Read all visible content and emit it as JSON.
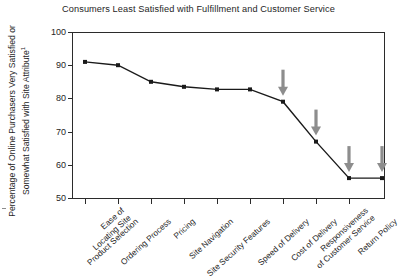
{
  "chart_data": {
    "type": "line",
    "title": "Consumers Least Satisfied with Fulfillment and Customer Service",
    "xlabel": "",
    "ylabel": "Percentage of Online Purchasers Very Satisfied or Somewhat Satisfied with Site Attribute",
    "ylabel_line1": "Percentage of Online Purchasers Very Satisfied or",
    "ylabel_line2": "Somewhat Satisfied with Site Attribute",
    "ylabel_footnote_marker": "1",
    "ylim": [
      50,
      100
    ],
    "yticks": [
      100,
      90,
      80,
      70,
      60,
      50
    ],
    "ytick_labels": [
      "100",
      "90",
      "80",
      "70",
      "60",
      "50"
    ],
    "grid": false,
    "legend": false,
    "categories": [
      "Ease of Locating Site",
      "Product Selection",
      "Ordering Process",
      "Pricing",
      "Site Navigation",
      "Site Security Features",
      "Speed of Delivery",
      "Cost of Delivery",
      "Responsiveness of Customer Service",
      "Return Policy"
    ],
    "category_lines": [
      [
        "Ease of",
        "Locating Site"
      ],
      [
        "Product Selection"
      ],
      [
        "Ordering Process"
      ],
      [
        "Pricing"
      ],
      [
        "Site Navigation"
      ],
      [
        "Site Security Features"
      ],
      [
        "Speed of Delivery"
      ],
      [
        "Cost of Delivery"
      ],
      [
        "Responsiveness",
        "of Customer Service"
      ],
      [
        "Return Policy"
      ]
    ],
    "values": [
      91,
      90,
      85,
      83.5,
      82.7,
      82.7,
      79,
      67,
      56,
      56
    ],
    "series": [
      {
        "name": "Percentage Satisfied",
        "values": [
          91,
          90,
          85,
          83.5,
          82.7,
          82.7,
          79,
          67,
          56,
          56
        ],
        "line_color": "#1a1a1a",
        "marker": "square",
        "marker_color": "#1a1a1a"
      }
    ],
    "annotations": [
      {
        "kind": "arrow",
        "direction": "down",
        "target_category": "Speed of Delivery",
        "target_value": 79,
        "color": "#8d8d8d"
      },
      {
        "kind": "arrow",
        "direction": "down",
        "target_category": "Cost of Delivery",
        "target_value": 67,
        "color": "#8d8d8d"
      },
      {
        "kind": "arrow",
        "direction": "down",
        "target_category": "Responsiveness of Customer Service",
        "target_value": 56,
        "color": "#8d8d8d"
      },
      {
        "kind": "arrow",
        "direction": "down",
        "target_category": "Return Policy",
        "target_value": 56,
        "color": "#8d8d8d"
      }
    ],
    "colors": {
      "line": "#1a1a1a",
      "marker": "#1a1a1a",
      "axis": "#2b2b2b",
      "arrow": "#8d8d8d",
      "text": "#252525",
      "background": "#ffffff"
    }
  }
}
